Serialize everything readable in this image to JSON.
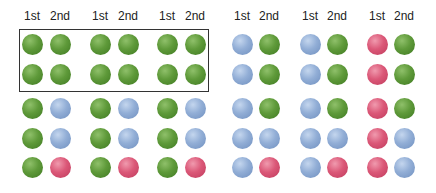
{
  "labels": [
    "1st",
    "2nd",
    "1st",
    "2nd",
    "1st",
    "2nd",
    "1st",
    "2nd",
    "1st",
    "2nd",
    "1st",
    "2nd"
  ],
  "colors": {
    "green": "#5f9a3a",
    "blue": "#92aed6",
    "red": "#db5878",
    "box_border": "#333333"
  },
  "groups": [
    {
      "columns": [
        32,
        60
      ],
      "rows": [
        [
          "green",
          "green"
        ],
        [
          "green",
          "green"
        ],
        [
          "green",
          "blue"
        ],
        [
          "green",
          "blue"
        ],
        [
          "green",
          "red"
        ]
      ]
    },
    {
      "columns": [
        100,
        128
      ],
      "rows": [
        [
          "green",
          "green"
        ],
        [
          "green",
          "green"
        ],
        [
          "green",
          "blue"
        ],
        [
          "green",
          "blue"
        ],
        [
          "green",
          "red"
        ]
      ]
    },
    {
      "columns": [
        167,
        195
      ],
      "rows": [
        [
          "green",
          "green"
        ],
        [
          "green",
          "green"
        ],
        [
          "green",
          "blue"
        ],
        [
          "green",
          "blue"
        ],
        [
          "green",
          "red"
        ]
      ]
    },
    {
      "columns": [
        242,
        269
      ],
      "rows": [
        [
          "blue",
          "green"
        ],
        [
          "blue",
          "green"
        ],
        [
          "blue",
          "green"
        ],
        [
          "blue",
          "blue"
        ],
        [
          "blue",
          "red"
        ]
      ]
    },
    {
      "columns": [
        310,
        337
      ],
      "rows": [
        [
          "blue",
          "green"
        ],
        [
          "blue",
          "green"
        ],
        [
          "blue",
          "green"
        ],
        [
          "blue",
          "blue"
        ],
        [
          "blue",
          "red"
        ]
      ]
    },
    {
      "columns": [
        377,
        404
      ],
      "rows": [
        [
          "red",
          "green"
        ],
        [
          "red",
          "green"
        ],
        [
          "red",
          "green"
        ],
        [
          "red",
          "blue"
        ],
        [
          "red",
          "blue"
        ]
      ]
    }
  ],
  "row_centers": [
    44,
    74,
    108,
    138,
    167
  ],
  "highlight_box": {
    "covers": "first two rows of first three groups"
  }
}
